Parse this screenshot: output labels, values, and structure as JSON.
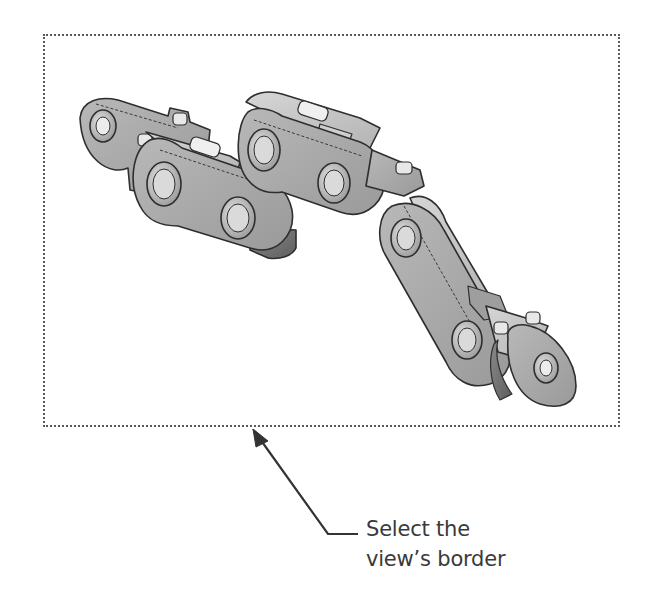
{
  "figure": {
    "drawing_view": {
      "border_style": "dotted",
      "border_color": "#5a5a5a",
      "content": "isometric view of roller chain links (CAD part, shaded with edges)",
      "part_fill_light": "#c8c8c8",
      "part_fill_mid": "#a9a9a9",
      "part_fill_dark": "#7e7e7e",
      "edge_color": "#2e2e2e"
    },
    "callout": {
      "line1": "Select the",
      "line2": "view’s border",
      "text_color": "#3a3a3a",
      "arrow_color": "#333333"
    }
  }
}
